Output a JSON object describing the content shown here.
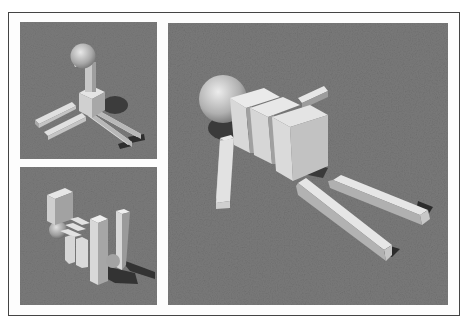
{
  "figure": {
    "panels": [
      {
        "id": "top-left",
        "view": "creature standing upright with sphere head on top, four leg bars spread on ground"
      },
      {
        "id": "bottom-left",
        "view": "creature viewed from the side with segmented body and raised limbs casting shadow"
      },
      {
        "id": "right",
        "view": "large close-up of creature lying forward: sphere head, three torso blocks, front arm bar, two rear leg bars"
      }
    ],
    "colors": {
      "ground": "#7b7b7b",
      "box_top": "#e6e6e6",
      "box_side_light": "#d2d2d2",
      "box_side_dark": "#a9a9a9",
      "shadow": "#3a3a3a",
      "border": "#444444"
    }
  }
}
